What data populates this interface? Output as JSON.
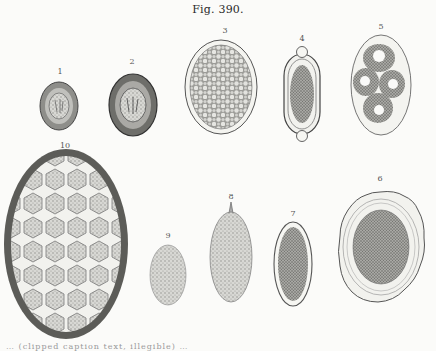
{
  "figure": {
    "title": "Fig. 390.",
    "panels": [
      {
        "label": "1",
        "description": "small oval egg with thick dark shell and inner embryo",
        "x": 60,
        "y": 73
      },
      {
        "label": "2",
        "description": "larger oval egg with thick dark shell and inner embryo",
        "x": 132,
        "y": 62
      },
      {
        "label": "3",
        "description": "oval egg filled with granular cells, thin clear shell",
        "x": 225,
        "y": 32
      },
      {
        "label": "4",
        "description": "elongated barrel-shaped egg with polar plugs",
        "x": 302,
        "y": 40
      },
      {
        "label": "5",
        "description": "oval egg containing four vacuolated cells",
        "x": 381,
        "y": 27
      },
      {
        "label": "6",
        "description": "rounded egg with wavy outer shell and granular interior",
        "x": 380,
        "y": 180
      },
      {
        "label": "7",
        "description": "oval egg with clear double shell and dark granular content",
        "x": 293,
        "y": 215
      },
      {
        "label": "8",
        "description": "elongated egg with pointed spine at one end",
        "x": 231,
        "y": 198
      },
      {
        "label": "9",
        "description": "small stippled oval egg",
        "x": 168,
        "y": 236
      },
      {
        "label": "10",
        "description": "large oval egg with thick dark shell and polygonal cell pattern",
        "x": 65,
        "y": 147
      }
    ]
  },
  "caption": {
    "text": "… (clipped caption text, illegible) …"
  },
  "colors": {
    "paper": "#fbfbf9",
    "ink": "#3a3a3a",
    "shell_dark": "#5a5a5a",
    "granule": "#8a8a8a"
  }
}
